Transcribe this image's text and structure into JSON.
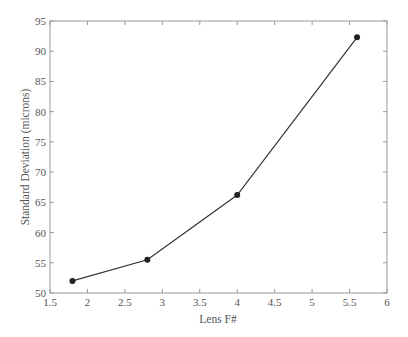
{
  "chart_data": {
    "type": "line",
    "title": "",
    "xlabel": "Lens F#",
    "ylabel": "Standard Deviation (microns)",
    "x": [
      1.8,
      2.8,
      4.0,
      5.6
    ],
    "series": [
      {
        "name": "Standard Deviation",
        "values": [
          52.0,
          55.5,
          66.2,
          92.3
        ],
        "marker": "circle",
        "color": "#333333"
      }
    ],
    "xlim": [
      1.5,
      6
    ],
    "ylim": [
      50,
      95
    ],
    "xticks": [
      1.5,
      2,
      2.5,
      3,
      3.5,
      4,
      4.5,
      5,
      5.5,
      6
    ],
    "xtick_labels": [
      "1.5",
      "2",
      "2.5",
      "3",
      "3.5",
      "4",
      "4.5",
      "5",
      "5.5",
      "6"
    ],
    "yticks": [
      50,
      55,
      60,
      65,
      70,
      75,
      80,
      85,
      90,
      95
    ],
    "ytick_labels": [
      "50",
      "55",
      "60",
      "65",
      "70",
      "75",
      "80",
      "85",
      "90",
      "95"
    ],
    "grid": false,
    "legend": null
  },
  "colors": {
    "axis": "#999999",
    "line": "#333333",
    "marker": "#222222",
    "text": "#555555"
  }
}
